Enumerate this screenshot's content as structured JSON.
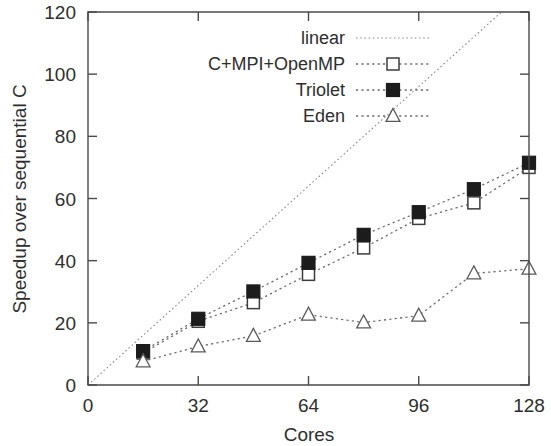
{
  "chart_data": {
    "type": "line",
    "title": "",
    "xlabel": "Cores",
    "ylabel": "Speedup over sequential C",
    "xlim": [
      0,
      128
    ],
    "ylim": [
      0,
      120
    ],
    "xticks": [
      0,
      32,
      64,
      96,
      128
    ],
    "yticks": [
      0,
      20,
      40,
      60,
      80,
      100,
      120
    ],
    "xtick_labels": [
      "0",
      "32",
      "64",
      "96",
      "128"
    ],
    "ytick_labels": [
      "0",
      "20",
      "40",
      "60",
      "80",
      "100",
      "120"
    ],
    "grid": false,
    "legend_position": "top-center",
    "x": [
      16,
      32,
      48,
      64,
      80,
      96,
      112,
      128
    ],
    "series": [
      {
        "name": "linear",
        "marker": "none",
        "line": "dotted",
        "x": [
          0,
          128
        ],
        "values": [
          0,
          128
        ]
      },
      {
        "name": "C+MPI+OpenMP",
        "marker": "open-square",
        "line": "dotted",
        "x": [
          16,
          32,
          48,
          64,
          80,
          96,
          112,
          128
        ],
        "values": [
          10.3,
          20.5,
          26.5,
          35.6,
          44.1,
          53.6,
          58.6,
          70.0
        ]
      },
      {
        "name": "Triolet",
        "marker": "filled-square",
        "line": "dotted",
        "x": [
          16,
          32,
          48,
          64,
          80,
          96,
          112,
          128
        ],
        "values": [
          10.9,
          21.3,
          30.1,
          39.3,
          48.3,
          55.6,
          63.0,
          71.5
        ]
      },
      {
        "name": "Eden",
        "marker": "open-triangle",
        "line": "dotted",
        "x": [
          16,
          32,
          48,
          64,
          80,
          96,
          112,
          128
        ],
        "values": [
          7.6,
          12.4,
          15.8,
          22.6,
          20.1,
          22.3,
          35.9,
          37.4
        ]
      }
    ]
  },
  "legend": {
    "entries": [
      {
        "label": "linear"
      },
      {
        "label": "C+MPI+OpenMP"
      },
      {
        "label": "Triolet"
      },
      {
        "label": "Eden"
      }
    ]
  },
  "colors": {
    "axis": "#4a4a4a",
    "text": "#2e2e2e",
    "line": "#6e6e6e",
    "linear_line": "#8a8a8a",
    "filled_marker": "#1c1c1c",
    "open_marker_fill": "#ffffff",
    "background": "#ffffff"
  }
}
